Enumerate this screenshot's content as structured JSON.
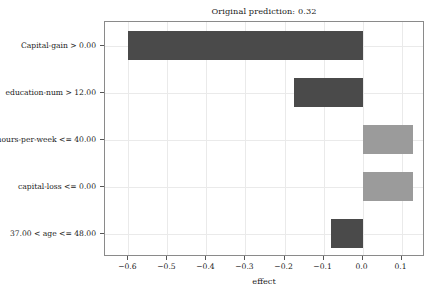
{
  "chart_data": {
    "type": "bar",
    "orientation": "horizontal",
    "title": "Original prediction: 0.32",
    "xlabel": "effect",
    "ylabel": "",
    "categories": [
      "Capital-gain > 0.00",
      "education-num > 12.00",
      "hours-per-week <= 40.00",
      "capital-loss <= 0.00",
      "37.00 < age <= 48.00"
    ],
    "values": [
      -0.6,
      -0.175,
      0.13,
      0.13,
      -0.08
    ],
    "xlim": [
      -0.66,
      0.16
    ],
    "xticks": [
      -0.6,
      -0.5,
      -0.4,
      -0.3,
      -0.2,
      -0.1,
      0.0,
      0.1
    ],
    "xtick_labels": [
      "−0.6",
      "−0.5",
      "−0.4",
      "−0.3",
      "−0.2",
      "−0.1",
      "0.0",
      "0.1"
    ],
    "grid": true,
    "legend": null,
    "bar_colors": {
      "negative": "#4a4a4a",
      "positive": "#9b9b9b"
    },
    "bars": [
      {
        "label": "Capital-gain > 0.00",
        "value": -0.6,
        "sign": "negative",
        "color": "#4a4a4a"
      },
      {
        "label": "education-num > 12.00",
        "value": -0.175,
        "sign": "negative",
        "color": "#4a4a4a"
      },
      {
        "label": "hours-per-week <= 40.00",
        "value": 0.13,
        "sign": "positive",
        "color": "#9b9b9b"
      },
      {
        "label": "capital-loss <= 0.00",
        "value": 0.13,
        "sign": "positive",
        "color": "#9b9b9b"
      },
      {
        "label": "37.00 < age <= 48.00",
        "value": -0.08,
        "sign": "negative",
        "color": "#4a4a4a"
      }
    ]
  },
  "figure": {
    "background": "#ffffff",
    "axes_edge_color": "#8a8a8a",
    "grid_color": "#eaeaea",
    "tick_color": "#555555",
    "text_color": "#1a1a1a"
  }
}
